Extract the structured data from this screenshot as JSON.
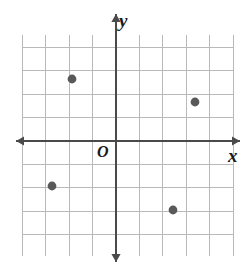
{
  "figure": {
    "labels": {
      "y_axis": "y",
      "x_axis": "x",
      "origin": "O"
    }
  },
  "colors": {
    "background": "#ffffff",
    "grid_line": "#b9b9b9",
    "axis_line": "#4a4a4a",
    "point_fill": "#595959",
    "label_text": "#1a1a1a"
  },
  "chart_data": {
    "type": "scatter",
    "title": "",
    "xlabel": "x",
    "ylabel": "y",
    "grid": true,
    "legend": null,
    "xlim": [
      -4,
      5
    ],
    "ylim": [
      -5,
      4.5
    ],
    "xticks": [
      -4,
      -3,
      -2,
      -1,
      0,
      1,
      2,
      3,
      4,
      5
    ],
    "yticks": [
      -5,
      -4,
      -3,
      -2,
      -1,
      0,
      1,
      2,
      3,
      4
    ],
    "tick_labels_shown": false,
    "axis_arrows": [
      "up",
      "down",
      "left",
      "right"
    ],
    "series": [
      {
        "name": "plotted points",
        "points": [
          {
            "x": -2,
            "y": 3,
            "px": 72,
            "py": 79
          },
          {
            "x": 3,
            "y": 2,
            "px": 195,
            "py": 102
          },
          {
            "x": -3,
            "y": -2,
            "px": 52,
            "py": 186
          },
          {
            "x": 2,
            "y": -3,
            "px": 173,
            "py": 210
          }
        ]
      }
    ]
  },
  "geometry": {
    "grid": {
      "left": 22,
      "top": 35,
      "right": 233,
      "bottom": 256,
      "cell": 23.4,
      "cols": 9,
      "rows": 9.4
    },
    "origin": {
      "x": 116,
      "y": 141
    },
    "point_radius": 4.4
  }
}
